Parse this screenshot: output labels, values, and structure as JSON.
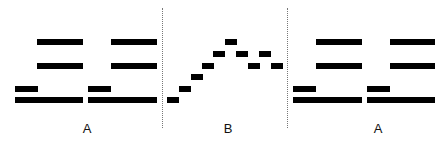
{
  "diagram": {
    "colors": {
      "bar": "#000000",
      "divider": "#777777",
      "background": "#ffffff",
      "label": "#111111"
    },
    "sections": [
      {
        "id": "left",
        "label": "A",
        "label_x": 87
      },
      {
        "id": "middle",
        "label": "B",
        "label_x": 228
      },
      {
        "id": "right",
        "label": "A",
        "label_x": 378
      }
    ],
    "dividers": [
      {
        "x": 162,
        "y1": 8,
        "y2": 128
      },
      {
        "x": 287,
        "y1": 8,
        "y2": 128
      }
    ],
    "bars": [
      {
        "section": "left",
        "x": 37,
        "y": 39,
        "w": 46,
        "h": 6
      },
      {
        "section": "left",
        "x": 37,
        "y": 63,
        "w": 46,
        "h": 6
      },
      {
        "section": "left",
        "x": 15,
        "y": 86,
        "w": 23,
        "h": 6
      },
      {
        "section": "left",
        "x": 15,
        "y": 97,
        "w": 68,
        "h": 6
      },
      {
        "section": "left",
        "x": 111,
        "y": 39,
        "w": 46,
        "h": 6
      },
      {
        "section": "left",
        "x": 111,
        "y": 63,
        "w": 46,
        "h": 6
      },
      {
        "section": "left",
        "x": 88,
        "y": 86,
        "w": 23,
        "h": 6
      },
      {
        "section": "left",
        "x": 88,
        "y": 97,
        "w": 69,
        "h": 6
      },
      {
        "section": "middle",
        "x": 167,
        "y": 97,
        "w": 12,
        "h": 6
      },
      {
        "section": "middle",
        "x": 179,
        "y": 86,
        "w": 12,
        "h": 6
      },
      {
        "section": "middle",
        "x": 191,
        "y": 74,
        "w": 12,
        "h": 6
      },
      {
        "section": "middle",
        "x": 202,
        "y": 63,
        "w": 12,
        "h": 6
      },
      {
        "section": "middle",
        "x": 213,
        "y": 51,
        "w": 12,
        "h": 6
      },
      {
        "section": "middle",
        "x": 225,
        "y": 39,
        "w": 12,
        "h": 6
      },
      {
        "section": "middle",
        "x": 236,
        "y": 51,
        "w": 12,
        "h": 6
      },
      {
        "section": "middle",
        "x": 248,
        "y": 63,
        "w": 12,
        "h": 6
      },
      {
        "section": "middle",
        "x": 259,
        "y": 51,
        "w": 12,
        "h": 6
      },
      {
        "section": "middle",
        "x": 271,
        "y": 63,
        "w": 12,
        "h": 6
      },
      {
        "section": "right",
        "x": 316,
        "y": 39,
        "w": 46,
        "h": 6
      },
      {
        "section": "right",
        "x": 316,
        "y": 63,
        "w": 46,
        "h": 6
      },
      {
        "section": "right",
        "x": 293,
        "y": 86,
        "w": 23,
        "h": 6
      },
      {
        "section": "right",
        "x": 293,
        "y": 97,
        "w": 69,
        "h": 6
      },
      {
        "section": "right",
        "x": 390,
        "y": 39,
        "w": 45,
        "h": 6
      },
      {
        "section": "right",
        "x": 390,
        "y": 63,
        "w": 45,
        "h": 6
      },
      {
        "section": "right",
        "x": 367,
        "y": 86,
        "w": 23,
        "h": 6
      },
      {
        "section": "right",
        "x": 367,
        "y": 97,
        "w": 68,
        "h": 6
      }
    ]
  }
}
